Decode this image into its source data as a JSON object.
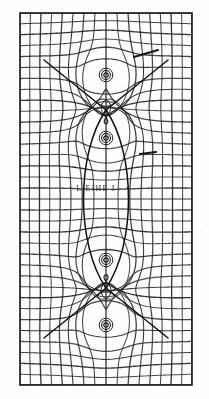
{
  "figure": {
    "media": "scanned halftone print",
    "background_color": "#fefefe",
    "ink_color": "#1a1a1a",
    "faint_ink_color": "#6d6d6d",
    "frame": {
      "x": 20,
      "y": 13,
      "width": 172,
      "height": 372
    }
  },
  "annotation": {
    "text": "· • L ΕΙΗΕ Ι · •",
    "legible": "illegible",
    "x": 62,
    "y": 184
  },
  "stray_marks": [
    {
      "name": "ink-stroke-upper-right",
      "x1": 134,
      "y1": 57,
      "x2": 158,
      "y2": 50
    },
    {
      "name": "ink-stroke-mid-right",
      "x1": 140,
      "y1": 154,
      "x2": 156,
      "y2": 152
    }
  ],
  "chart_data": {
    "type": "line",
    "subtitle": "Equipotentials and flux lines over a Cartesian background grid",
    "xlabel": "",
    "ylabel": "",
    "xlim": [
      0,
      172
    ],
    "ylim": [
      0,
      372
    ],
    "grid": true,
    "legend": "none",
    "background_grid": {
      "name": "cartesian-reference-grid",
      "vertical_line_count": 16,
      "horizontal_line_count": 34,
      "vertical_spacing_px": 10.75,
      "horizontal_spacing_px": 10.94,
      "color": "#2a2a2a"
    },
    "critical_points": [
      {
        "name": "saddle-upper",
        "type": "saddle",
        "x": 106,
        "y": 110,
        "order": 1
      },
      {
        "name": "saddle-lower",
        "type": "saddle",
        "x": 106,
        "y": 288,
        "order": 1
      },
      {
        "name": "pole-top",
        "type": "source",
        "x": 106,
        "y": 75
      },
      {
        "name": "pole-upper-inner",
        "type": "source",
        "x": 106,
        "y": 138
      },
      {
        "name": "pole-lower-inner",
        "type": "source",
        "x": 106,
        "y": 260
      },
      {
        "name": "pole-bottom",
        "type": "source",
        "x": 106,
        "y": 325
      }
    ],
    "separatrix": {
      "name": "lens-separatrix",
      "description": "closed lens joining the two saddle points",
      "top_y": 110,
      "bottom_y": 288,
      "half_width": 30
    },
    "families": [
      {
        "name": "equipotential-family",
        "count": 34,
        "orientation": "quasi-horizontal"
      },
      {
        "name": "flux-line-family",
        "count": 16,
        "orientation": "quasi-vertical"
      }
    ],
    "series": [
      {
        "name": "equipotentials",
        "values": []
      },
      {
        "name": "flux-lines",
        "values": []
      }
    ]
  }
}
